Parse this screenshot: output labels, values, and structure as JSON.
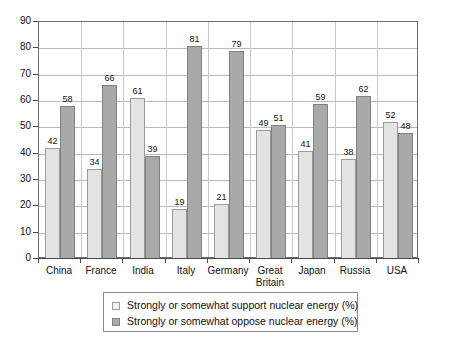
{
  "chart_data": {
    "type": "bar",
    "title": "",
    "subtitle": "",
    "xlabel": "",
    "ylabel": "",
    "ylim": [
      0,
      90
    ],
    "ytick_step": 10,
    "yticks": [
      "0",
      "10",
      "20",
      "30",
      "40",
      "50",
      "60",
      "70",
      "80",
      "90"
    ],
    "grid": true,
    "legend_position": "bottom",
    "categories": [
      "China",
      "France",
      "India",
      "Italy",
      "Germany",
      "Great Britain",
      "Japan",
      "Russia",
      "USA"
    ],
    "series": [
      {
        "name": "Strongly or somewhat support nuclear energy (%)",
        "color": "#e3e3e3",
        "values": [
          42,
          34,
          61,
          19,
          21,
          49,
          41,
          38,
          52
        ]
      },
      {
        "name": "Strongly or somewhat oppose nuclear energy (%)",
        "color": "#a9a9a9",
        "values": [
          58,
          66,
          39,
          81,
          79,
          51,
          59,
          62,
          48
        ]
      }
    ]
  },
  "legend": {
    "items": [
      {
        "label": "Strongly or somewhat support nuclear energy (%)",
        "swatch": "support"
      },
      {
        "label": "Strongly or somewhat oppose nuclear energy (%)",
        "swatch": "oppose"
      }
    ]
  }
}
